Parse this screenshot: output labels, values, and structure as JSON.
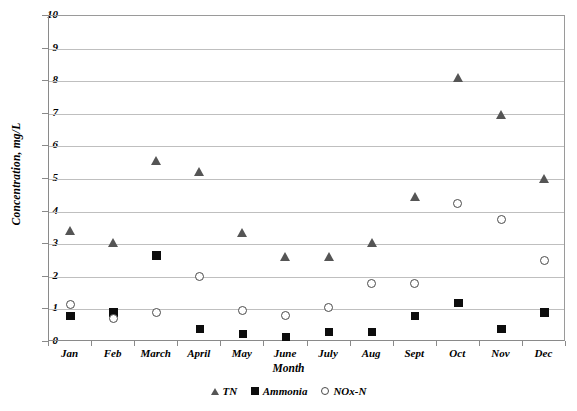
{
  "chart_data": {
    "type": "scatter",
    "title": "",
    "xlabel": "Month",
    "ylabel": "Concentration, mg/L",
    "categories": [
      "Jan",
      "Feb",
      "March",
      "April",
      "May",
      "June",
      "July",
      "Aug",
      "Sept",
      "Oct",
      "Nov",
      "Dec"
    ],
    "ylim": [
      0,
      10
    ],
    "yticks": [
      0,
      1,
      2,
      3,
      4,
      5,
      6,
      7,
      8,
      9,
      10
    ],
    "ytick_labels": [
      "0",
      "1",
      "2",
      "3",
      "4",
      "5",
      "6",
      "7",
      "8",
      "9",
      "10"
    ],
    "grid": true,
    "legend_position": "bottom-center",
    "series": [
      {
        "name": "TN",
        "marker": "triangle",
        "color": "#555555",
        "values": [
          3.4,
          3.05,
          5.55,
          5.2,
          3.35,
          2.6,
          2.6,
          3.05,
          4.45,
          8.1,
          6.95,
          5.0
        ]
      },
      {
        "name": "Ammonia",
        "marker": "square",
        "color": "#0d0d0d",
        "values": [
          0.8,
          0.9,
          2.65,
          0.4,
          0.25,
          0.15,
          0.3,
          0.3,
          0.8,
          1.2,
          0.4,
          0.9
        ]
      },
      {
        "name": "NOx-N",
        "marker": "circle-open",
        "color": "#4a4a4a",
        "values": [
          1.15,
          0.7,
          0.9,
          2.0,
          0.95,
          0.8,
          1.05,
          1.8,
          1.8,
          4.25,
          3.75,
          2.5
        ]
      }
    ]
  },
  "axis": {
    "y_title": "Concentration, mg/L",
    "x_title": "Month"
  },
  "legend": {
    "items": [
      {
        "label": "TN",
        "marker": "triangle-icon"
      },
      {
        "label": "Ammonia",
        "marker": "square-icon"
      },
      {
        "label": "NOx-N",
        "marker": "circle-open-icon"
      }
    ]
  }
}
